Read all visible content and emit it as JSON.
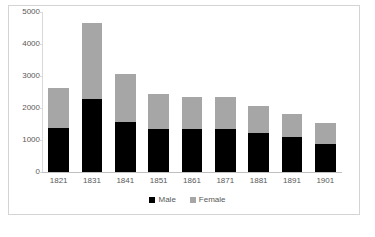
{
  "chart_data": {
    "type": "bar",
    "subtype": "stacked",
    "title": "",
    "xlabel": "",
    "ylabel": "",
    "categories": [
      "1821",
      "1831",
      "1841",
      "1851",
      "1861",
      "1871",
      "1881",
      "1891",
      "1901"
    ],
    "series": [
      {
        "name": "Male",
        "color": "#000000",
        "values": [
          1360,
          2290,
          1550,
          1350,
          1330,
          1350,
          1220,
          1100,
          880
        ]
      },
      {
        "name": "Female",
        "color": "#a6a6a6",
        "values": [
          1260,
          2380,
          1520,
          1100,
          1010,
          1000,
          840,
          700,
          640
        ]
      }
    ],
    "totals": [
      2620,
      4670,
      3070,
      2450,
      2340,
      2350,
      2060,
      1800,
      1520
    ],
    "ylim": [
      0,
      5000
    ],
    "ytick_values": [
      0,
      1000,
      2000,
      3000,
      4000,
      5000
    ],
    "ytick_labels": [
      "0",
      "1000",
      "2000",
      "3000",
      "4000",
      "5000"
    ],
    "grid": false,
    "legend_position": "bottom"
  },
  "legend": {
    "items": [
      {
        "label": "Male",
        "swatch": "male-swatch-icon"
      },
      {
        "label": "Female",
        "swatch": "female-swatch-icon"
      }
    ]
  },
  "colors": {
    "male": "#000000",
    "female": "#a6a6a6",
    "axis": "#bfbfbf",
    "tick_text": "#595959",
    "frame_border": "#d4d4d4",
    "background": "#ffffff"
  }
}
